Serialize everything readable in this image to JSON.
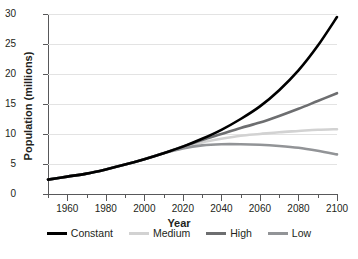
{
  "chart_data": {
    "type": "line",
    "title": "",
    "xlabel": "Year",
    "ylabel": "Population (millions)",
    "xlim": [
      1950,
      2100
    ],
    "ylim": [
      0,
      30
    ],
    "xticks": [
      1960,
      1980,
      2000,
      2020,
      2040,
      2060,
      2080,
      2100
    ],
    "yticks": [
      0,
      5,
      10,
      15,
      20,
      25,
      30
    ],
    "xtick_minor_step": 10,
    "grid": "horizontal",
    "legend_position": "bottom",
    "x": [
      1950,
      1960,
      1970,
      1980,
      1990,
      2000,
      2010,
      2020,
      2030,
      2040,
      2050,
      2060,
      2070,
      2080,
      2090,
      2100
    ],
    "series": [
      {
        "name": "Constant",
        "color": "#000000",
        "width": 2.6,
        "values": [
          2.4,
          2.9,
          3.4,
          4.1,
          4.9,
          5.8,
          6.8,
          7.9,
          9.2,
          10.7,
          12.5,
          14.6,
          17.3,
          20.6,
          24.7,
          29.5
        ]
      },
      {
        "name": "Medium",
        "color": "#d2d2d2",
        "width": 2.6,
        "values": [
          2.4,
          2.9,
          3.4,
          4.1,
          4.9,
          5.8,
          6.8,
          7.8,
          8.6,
          9.2,
          9.7,
          10.0,
          10.3,
          10.5,
          10.7,
          10.8
        ]
      },
      {
        "name": "High",
        "color": "#6d6e70",
        "width": 2.6,
        "values": [
          2.4,
          2.9,
          3.4,
          4.1,
          4.9,
          5.8,
          6.8,
          7.9,
          9.0,
          10.0,
          11.0,
          11.9,
          13.0,
          14.2,
          15.5,
          16.8
        ]
      },
      {
        "name": "Low",
        "color": "#929497",
        "width": 2.6,
        "values": [
          2.4,
          2.9,
          3.4,
          4.1,
          4.9,
          5.8,
          6.8,
          7.6,
          8.1,
          8.3,
          8.3,
          8.2,
          8.0,
          7.7,
          7.2,
          6.6
        ]
      }
    ]
  },
  "axis": {
    "ylabel": "Population (millions)",
    "xlabel": "Year"
  }
}
